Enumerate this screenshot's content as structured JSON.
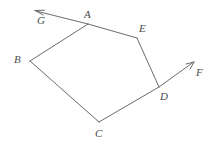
{
  "figure": {
    "background_color": "#ffffff",
    "stroke_color": "#6b6b6b",
    "label_color": "#4a4a4a",
    "stroke_width": 1,
    "width": 217,
    "height": 145
  },
  "points": {
    "A": {
      "label": "A",
      "x": 88,
      "y": 24,
      "label_x": 84,
      "label_y": 9
    },
    "B": {
      "label": "B",
      "x": 30,
      "y": 61,
      "label_x": 14,
      "label_y": 54
    },
    "C": {
      "label": "C",
      "x": 99,
      "y": 122,
      "label_x": 95,
      "label_y": 128
    },
    "D": {
      "label": "D",
      "x": 159,
      "y": 87,
      "label_x": 160,
      "label_y": 91
    },
    "E": {
      "label": "E",
      "x": 137,
      "y": 38,
      "label_x": 139,
      "label_y": 23
    },
    "F": {
      "label": "F",
      "x": 194,
      "y": 62,
      "label_x": 196,
      "label_y": 67
    },
    "G": {
      "label": "G",
      "x": 35,
      "y": 11,
      "label_x": 37,
      "label_y": 15
    }
  },
  "edges": [
    {
      "name": "edge-A-B",
      "from": "A",
      "to": "B"
    },
    {
      "name": "edge-B-C",
      "from": "B",
      "to": "C"
    },
    {
      "name": "edge-C-D",
      "from": "C",
      "to": "D"
    },
    {
      "name": "edge-D-E",
      "from": "D",
      "to": "E"
    },
    {
      "name": "edge-E-A",
      "from": "E",
      "to": "A"
    }
  ],
  "rays": [
    {
      "name": "ray-A-G",
      "from": "A",
      "to": "G",
      "arrowhead": true
    },
    {
      "name": "ray-D-F",
      "from": "D",
      "to": "F",
      "arrowhead": true
    }
  ]
}
